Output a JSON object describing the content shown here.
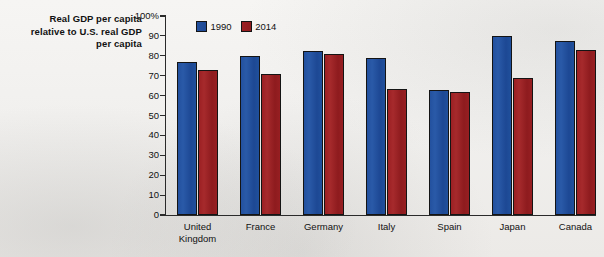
{
  "chart_data": {
    "type": "bar",
    "title": "Real GDP per capita relative to U.S. real GDP per capita",
    "title_lines": [
      "Real GDP per capita",
      "relative to U.S. real GDP",
      "per capita"
    ],
    "xlabel": "",
    "ylabel": "",
    "ylim": [
      0,
      100
    ],
    "y_unit": "%",
    "grid": false,
    "legend_position": "top-left-inside",
    "categories": [
      "United Kingdom",
      "France",
      "Germany",
      "Italy",
      "Spain",
      "Japan",
      "Canada"
    ],
    "category_label_lines": [
      [
        "United",
        "Kingdom"
      ],
      [
        "France"
      ],
      [
        "Germany"
      ],
      [
        "Italy"
      ],
      [
        "Spain"
      ],
      [
        "Japan"
      ],
      [
        "Canada"
      ]
    ],
    "y_ticks": [
      {
        "value": 100,
        "label": "100%"
      },
      {
        "value": 90,
        "label": "90"
      },
      {
        "value": 80,
        "label": "80"
      },
      {
        "value": 70,
        "label": "70"
      },
      {
        "value": 60,
        "label": "60"
      },
      {
        "value": 50,
        "label": "50"
      },
      {
        "value": 40,
        "label": "40"
      },
      {
        "value": 30,
        "label": "30"
      },
      {
        "value": 20,
        "label": "20"
      },
      {
        "value": 10,
        "label": "10"
      },
      {
        "value": 0,
        "label": "0"
      }
    ],
    "series": [
      {
        "name": "1990",
        "color": "#20509c",
        "values": [
          77,
          80,
          82.5,
          79,
          63,
          90,
          87.5
        ]
      },
      {
        "name": "2014",
        "color": "#971f22",
        "values": [
          73,
          71,
          81,
          63.5,
          62,
          69,
          83
        ]
      }
    ]
  },
  "legend": {
    "items": [
      {
        "label": "1990",
        "swatch": "blue-swatch"
      },
      {
        "label": "2014",
        "swatch": "red-swatch"
      }
    ]
  }
}
